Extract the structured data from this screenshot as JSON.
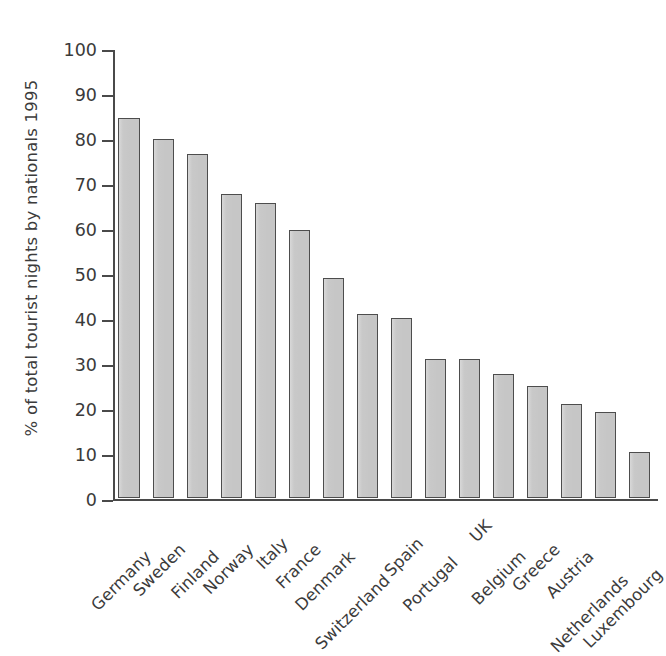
{
  "chart_data": {
    "type": "bar",
    "title": "",
    "subtitle": "",
    "xlabel": "",
    "ylabel": "% of total tourist nights by nationals 1995",
    "ylim": [
      0,
      100
    ],
    "ytick_labels": [
      "100",
      "90",
      "80",
      "70",
      "60",
      "50",
      "40",
      "30",
      "20",
      "10",
      "0"
    ],
    "ytick_values": [
      100,
      90,
      80,
      70,
      60,
      50,
      40,
      30,
      20,
      10,
      0
    ],
    "grid": false,
    "legend": false,
    "legend_position": "none",
    "bar_color": "#c6c6c6",
    "bar_edge_color": "#4d4d4d",
    "axis_color": "#4a4a4a",
    "categories": [
      "Germany",
      "Sweden",
      "Finland",
      "Norway",
      "Italy",
      "France",
      "Denmark",
      "Switzerland",
      "Spain",
      "Portugal",
      "UK",
      "Belgium",
      "Greece",
      "Austria",
      "Netherlands",
      "Luxembourg"
    ],
    "values": [
      84.5,
      79.8,
      76.5,
      67.5,
      65.5,
      59.5,
      49,
      41,
      40,
      31,
      31,
      27.5,
      25,
      20.8,
      19.2,
      10.2
    ]
  }
}
